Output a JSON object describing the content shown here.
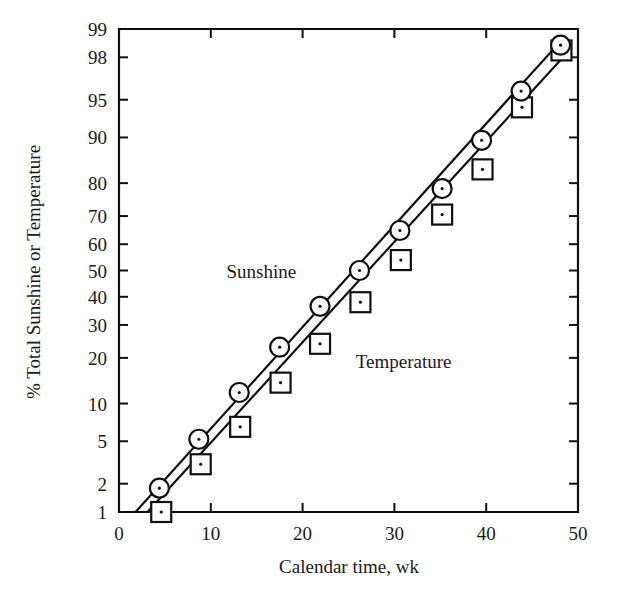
{
  "chart_data": {
    "type": "scatter",
    "title": "",
    "xlabel": "Calendar time, wk",
    "ylabel": "% Total Sunshine or Temperature",
    "yscale": "probability",
    "xlim": [
      0,
      50
    ],
    "ylim": [
      1,
      99
    ],
    "grid": false,
    "legend_position": "inline-annotations",
    "xticks": [
      0,
      10,
      20,
      30,
      40,
      50
    ],
    "xtick_labels": [
      "0",
      "10",
      "20",
      "30",
      "40",
      "50"
    ],
    "yticks": [
      1,
      2,
      5,
      10,
      20,
      30,
      40,
      50,
      60,
      70,
      80,
      90,
      95,
      98,
      99
    ],
    "ytick_labels": [
      "1",
      "2",
      "5",
      "10",
      "20",
      "30",
      "40",
      "50",
      "60",
      "70",
      "80",
      "90",
      "95",
      "98",
      "99"
    ],
    "annotations": [
      {
        "text": "Sunshine",
        "x": 15.5,
        "y": 47.0
      },
      {
        "text": "Temperature",
        "x": 31.0,
        "y": 17.5
      }
    ],
    "series": [
      {
        "name": "Sunshine",
        "marker": "circle",
        "points": [
          {
            "x": 4.4,
            "y": 1.8
          },
          {
            "x": 8.7,
            "y": 5.2
          },
          {
            "x": 13.1,
            "y": 12.0
          },
          {
            "x": 17.5,
            "y": 23.0
          },
          {
            "x": 21.9,
            "y": 36.5
          },
          {
            "x": 26.2,
            "y": 50.0
          },
          {
            "x": 30.6,
            "y": 65.0
          },
          {
            "x": 35.2,
            "y": 78.5
          },
          {
            "x": 39.5,
            "y": 89.5
          },
          {
            "x": 43.8,
            "y": 95.8
          },
          {
            "x": 48.1,
            "y": 98.5
          }
        ],
        "fit_line": {
          "x0": 1.8,
          "y0": 1.0,
          "x1": 48.6,
          "y1": 98.8
        }
      },
      {
        "name": "Temperature",
        "marker": "square",
        "points": [
          {
            "x": 4.6,
            "y": 1.0
          },
          {
            "x": 8.9,
            "y": 3.1
          },
          {
            "x": 13.2,
            "y": 6.6
          },
          {
            "x": 17.6,
            "y": 14.0
          },
          {
            "x": 21.9,
            "y": 24.0
          },
          {
            "x": 26.3,
            "y": 38.0
          },
          {
            "x": 30.7,
            "y": 54.0
          },
          {
            "x": 35.2,
            "y": 70.5
          },
          {
            "x": 39.6,
            "y": 83.5
          },
          {
            "x": 43.9,
            "y": 94.2
          },
          {
            "x": 48.2,
            "y": 98.3
          }
        ],
        "fit_line": {
          "x0": 3.1,
          "y0": 1.0,
          "x1": 49.3,
          "y1": 98.4
        }
      }
    ]
  },
  "axes": {
    "x_title": "Calendar time, wk",
    "y_title": "% Total Sunshine or Temperature"
  }
}
